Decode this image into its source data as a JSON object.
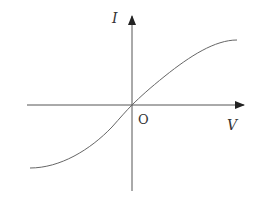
{
  "diagram": {
    "type": "I-V characteristic curve",
    "axes": {
      "y_label": "I",
      "x_label": "V",
      "origin_label": "O"
    },
    "curve": {
      "shape": "S-shaped (sigmoid) through origin",
      "passes_through_origin": true
    },
    "colors": {
      "line": "#555555",
      "text": "#333333"
    }
  }
}
